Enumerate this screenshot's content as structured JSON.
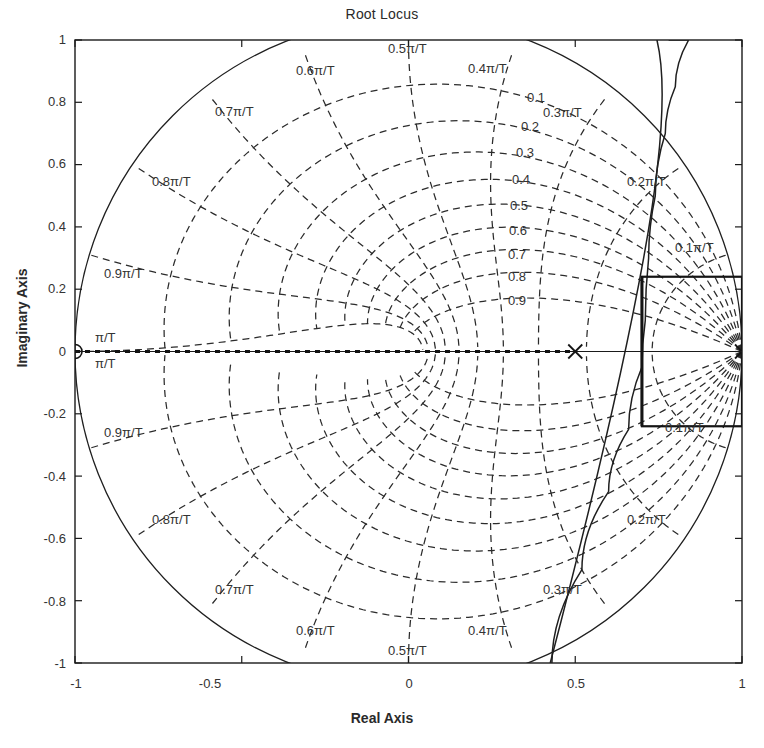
{
  "chart_data": {
    "type": "line",
    "title": "Root Locus",
    "xlabel": "Real Axis",
    "ylabel": "Imaginary Axis",
    "xlim": [
      -1,
      1
    ],
    "ylim": [
      -1,
      1
    ],
    "grid": "z-plane polar grid (dashed)",
    "legend": "none",
    "xticks": [
      "-1",
      "-0.5",
      "0",
      "0.5",
      "1"
    ],
    "xtickvals": [
      -1,
      -0.5,
      0,
      0.5,
      1
    ],
    "yticks": [
      "1",
      "0.8",
      "0.6",
      "0.4",
      "0.2",
      "0",
      "-0.2",
      "-0.4",
      "-0.6",
      "-0.8",
      "-1"
    ],
    "ytickvals": [
      1,
      0.8,
      0.6,
      0.4,
      0.2,
      0,
      -0.2,
      -0.4,
      -0.6,
      -0.8,
      -1
    ],
    "unit_circle": {
      "radius": 1.0,
      "center": [
        0,
        0
      ],
      "style": "solid"
    },
    "damping_labels": [
      "0.1",
      "0.2",
      "0.3",
      "0.4",
      "0.5",
      "0.6",
      "0.7",
      "0.8",
      "0.9"
    ],
    "damping_values": [
      0.1,
      0.2,
      0.3,
      0.4,
      0.5,
      0.6,
      0.7,
      0.8,
      0.9
    ],
    "frequency_labels_upper": [
      "0.5π/T",
      "0.6π/T",
      "0.7π/T",
      "0.8π/T",
      "0.9π/T",
      "π/T",
      "0.4π/T",
      "0.3π/T",
      "0.2π/T",
      "0.1π/T"
    ],
    "frequency_labels_lower": [
      "0.5π/T",
      "0.6π/T",
      "0.7π/T",
      "0.8π/T",
      "0.9π/T",
      "π/T",
      "0.4π/T",
      "0.3π/T",
      "0.2π/T",
      "0.1π/T"
    ],
    "frequency_values": [
      0.1,
      0.2,
      0.3,
      0.4,
      0.5,
      0.6,
      0.7,
      0.8,
      0.9,
      1.0
    ],
    "markers": [
      {
        "symbol": "o",
        "type": "zero",
        "x": -1.0,
        "y": 0.0
      },
      {
        "symbol": "x",
        "type": "pole",
        "x": 0.5,
        "y": 0.0
      },
      {
        "symbol": "x",
        "type": "pole",
        "x": 1.0,
        "y": 0.0
      }
    ],
    "locus_branches": [
      {
        "name": "real-axis segment",
        "points": [
          [
            -1.0,
            0.0
          ],
          [
            0.5,
            0.0
          ]
        ]
      },
      {
        "name": "breakaway upper branch",
        "points": [
          [
            0.43,
            -1.0
          ],
          [
            0.52,
            -0.7
          ],
          [
            0.6,
            -0.45
          ],
          [
            0.66,
            -0.25
          ],
          [
            0.7,
            -0.05
          ],
          [
            0.71,
            0.1
          ],
          [
            0.72,
            0.3
          ],
          [
            0.74,
            0.5
          ],
          [
            0.77,
            0.7
          ],
          [
            0.8,
            0.85
          ],
          [
            0.84,
            1.0
          ]
        ]
      }
    ],
    "selected_region_box": {
      "x_range": [
        0.7,
        1.0
      ],
      "y_range": [
        -0.24,
        0.24
      ]
    }
  },
  "axes": {
    "title": "Root Locus",
    "xlabel": "Real Axis",
    "ylabel": "Imaginary Axis"
  },
  "freq_grid_labels": {
    "u05": "0.5π/T",
    "u06": "0.6π/T",
    "u07": "0.7π/T",
    "u08": "0.8π/T",
    "u09": "0.9π/T",
    "upi_a": "π/T",
    "upi_b": "π/T",
    "u04": "0.4π/T",
    "u03": "0.3π/T",
    "u02": "0.2π/T",
    "u01": "0.1π/T",
    "l09": "0.9π/T",
    "l08": "0.8π/T",
    "l07": "0.7π/T",
    "l06": "0.6π/T",
    "l05": "0.5π/T",
    "l04": "0.4π/T",
    "l03": "0.3π/T",
    "l02": "0.2π/T",
    "l01": "0.1π/T"
  },
  "damping": {
    "d1": "0.1",
    "d2": "0.2",
    "d3": "0.3",
    "d4": "0.4",
    "d5": "0.5",
    "d6": "0.6",
    "d7": "0.7",
    "d8": "0.8",
    "d9": "0.9"
  },
  "colors": {
    "axis": "#1a1a1a",
    "grid": "#262626",
    "locus": "#1f1f1f",
    "background": "#ffffff"
  }
}
